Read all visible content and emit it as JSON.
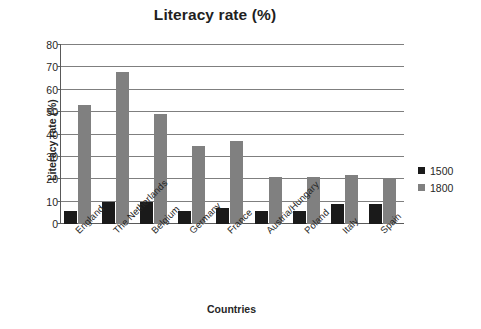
{
  "chart_data": {
    "type": "bar",
    "title": "Literacy rate (%)",
    "xlabel": "Countries",
    "ylabel": "Literacy rate (%)",
    "ylim": [
      0,
      80
    ],
    "yticks": [
      0,
      10,
      20,
      30,
      40,
      50,
      60,
      70,
      80
    ],
    "grid": true,
    "legend_position": "right",
    "categories": [
      "England",
      "The Netherlands",
      "Belgium",
      "Germany",
      "France",
      "Austria/Hungary",
      "Poland",
      "Italy",
      "Spain"
    ],
    "series": [
      {
        "name": "1500",
        "color": "#1a1a1a",
        "values": [
          6,
          10,
          10,
          6,
          7,
          6,
          6,
          9,
          9
        ]
      },
      {
        "name": "1800",
        "color": "#808080",
        "values": [
          53,
          68,
          49,
          35,
          37,
          21,
          21,
          22,
          20
        ]
      }
    ]
  }
}
